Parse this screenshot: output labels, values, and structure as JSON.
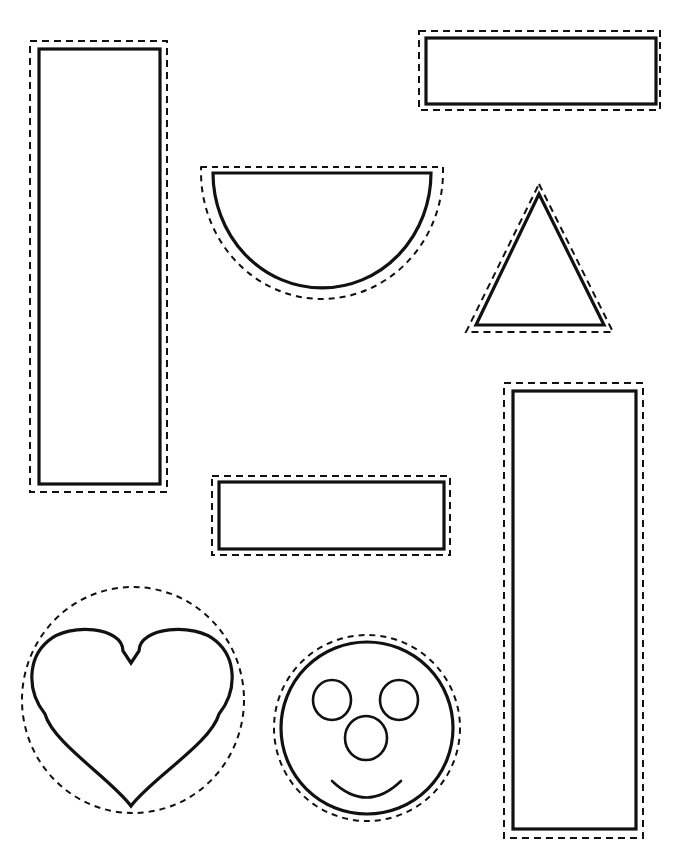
{
  "page": {
    "background_color": "#ffffff",
    "ink_color": "#111111",
    "width": 679,
    "height": 858
  },
  "style": {
    "solid_stroke_width": 3.2,
    "dashed_stroke_width": 2.0,
    "dash_pattern": "7 5"
  },
  "shapes": [
    {
      "id": "tall-rectangle-left",
      "name": "Tall vertical rectangle (left)",
      "type": "rectangle",
      "solid": {
        "x": 39,
        "y": 49,
        "width": 121,
        "height": 435
      },
      "dashed": {
        "x": 30,
        "y": 41,
        "width": 137,
        "height": 451
      }
    },
    {
      "id": "wide-rectangle-top-right",
      "name": "Wide horizontal rectangle (top right)",
      "type": "rectangle",
      "solid": {
        "x": 426,
        "y": 38,
        "width": 230,
        "height": 66
      },
      "dashed": {
        "x": 419,
        "y": 31,
        "width": 241,
        "height": 79
      }
    },
    {
      "id": "semicircle",
      "name": "Semicircle / half circle",
      "type": "semicircle",
      "solid": {
        "cx": 322,
        "cy": 173,
        "rx": 109,
        "ry": 115
      },
      "dashed": {
        "cx": 322,
        "cy": 167,
        "rx": 121,
        "ry": 127
      }
    },
    {
      "id": "triangle",
      "name": "Triangle",
      "type": "triangle",
      "solid": {
        "apex_x": 539,
        "apex_y": 194,
        "base_y": 325,
        "base_left_x": 476,
        "base_right_x": 604
      },
      "dashed": {
        "apex_x": 539,
        "apex_y": 184,
        "base_y": 332,
        "base_left_x": 466,
        "base_right_x": 613
      }
    },
    {
      "id": "tall-rectangle-right",
      "name": "Tall vertical rectangle (right)",
      "type": "rectangle",
      "solid": {
        "x": 513,
        "y": 391,
        "width": 123,
        "height": 438
      },
      "dashed": {
        "x": 504,
        "y": 383,
        "width": 139,
        "height": 455
      }
    },
    {
      "id": "wide-rectangle-middle",
      "name": "Wide horizontal rectangle (middle)",
      "type": "rectangle",
      "solid": {
        "x": 219,
        "y": 482,
        "width": 225,
        "height": 67
      },
      "dashed": {
        "x": 212,
        "y": 476,
        "width": 238,
        "height": 79
      }
    },
    {
      "id": "heart",
      "name": "Heart",
      "type": "heart",
      "solid": {
        "cx": 131,
        "top_y": 629,
        "bottom_y": 806,
        "left_x": 32,
        "right_x": 232
      },
      "dashed": {
        "cx": 133,
        "cy": 700,
        "rx": 111,
        "ry": 113
      }
    },
    {
      "id": "smiley-face",
      "name": "Smiley face circle",
      "type": "face",
      "solid": {
        "cx": 367,
        "cy": 728,
        "r": 86
      },
      "dashed": {
        "cx": 367,
        "cy": 728,
        "r": 93
      },
      "features": {
        "left_eye": {
          "cx": 332,
          "cy": 700,
          "rx": 19,
          "ry": 20
        },
        "right_eye": {
          "cx": 399,
          "cy": 700,
          "rx": 19,
          "ry": 20
        },
        "nose": {
          "cx": 366,
          "cy": 738,
          "rx": 21,
          "ry": 22
        },
        "mouth": {
          "start_x": 332,
          "start_y": 781,
          "end_x": 401,
          "end_y": 781,
          "arc_depth": 22
        }
      }
    }
  ],
  "labels": {
    "solid_line_meaning": "shape outline",
    "dashed_line_meaning": "cutting guide"
  }
}
